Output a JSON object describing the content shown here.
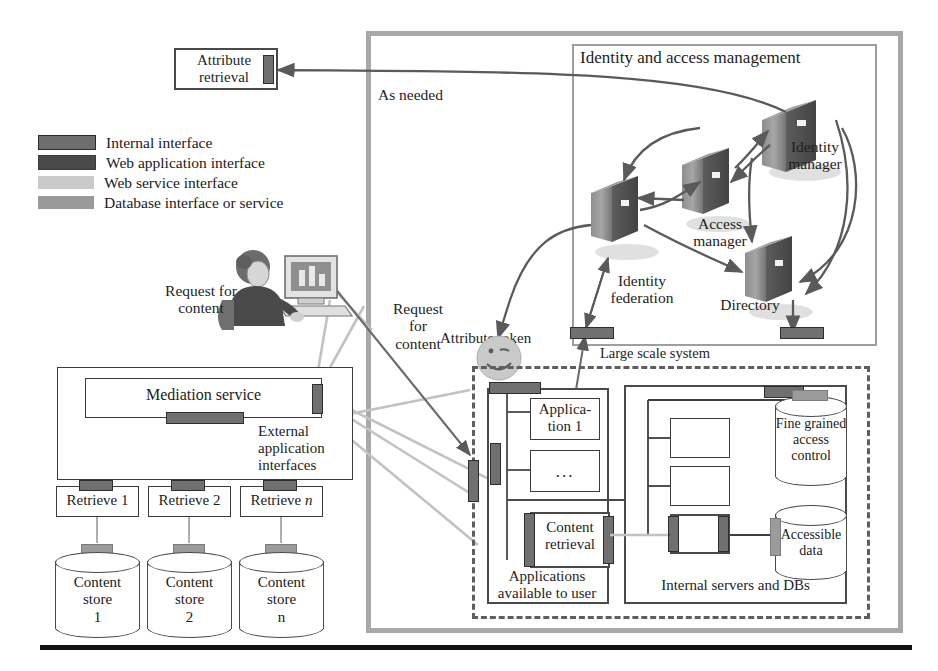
{
  "legend": {
    "items": [
      {
        "label": "Internal interface",
        "swatch": "internal",
        "color": "#6e6e6e"
      },
      {
        "label": "Web application interface",
        "swatch": "webapp",
        "color": "#4a4a4a"
      },
      {
        "label": "Web service interface",
        "swatch": "websvc",
        "color": "#c9c9c9"
      },
      {
        "label": "Database interface or service",
        "swatch": "db",
        "color": "#9a9a9a"
      }
    ]
  },
  "nodes": {
    "attribute_retrieval": "Attribute\nretrieval",
    "as_needed": "As needed",
    "iam_title": "Identity and access management",
    "identity_manager": "Identity\nmanager",
    "access_manager": "Access\nmanager",
    "identity_federation": "Identity\nfederation",
    "directory": "Directory",
    "large_scale_system": "Large scale system",
    "attribute_token": "Attribute token",
    "request_for_content_user": "Request for\ncontent",
    "request_for_content_mid": "Request\nfor\ncontent",
    "mediation_service": "Mediation service",
    "external_app_interfaces": "External\napplication\ninterfaces",
    "retrieve_1": "Retrieve 1",
    "retrieve_2": "Retrieve 2",
    "retrieve_n": "Retrieve n",
    "content_store_1": "Content\nstore\n1",
    "content_store_2": "Content\nstore\n2",
    "content_store_n": "Content\nstore\nn",
    "application_1": "Applica-\ntion 1",
    "application_ellipsis": "...",
    "content_retrieval": "Content\nretrieval",
    "applications_available": "Applications\navailable to user",
    "internal_servers_dbs": "Internal servers and DBs",
    "fine_grained_access_control": "Fine grained\naccess\ncontrol",
    "accessible_data": "Accessible\ndata"
  },
  "colors": {
    "internal_interface": "#6e6e6e",
    "web_application_interface": "#4a4a4a",
    "web_service_interface": "#c9c9c9",
    "database_interface": "#9a9a9a",
    "outer_frame": "#a8a8a8",
    "arrow": "#5a5a5a",
    "background": "#ffffff"
  }
}
